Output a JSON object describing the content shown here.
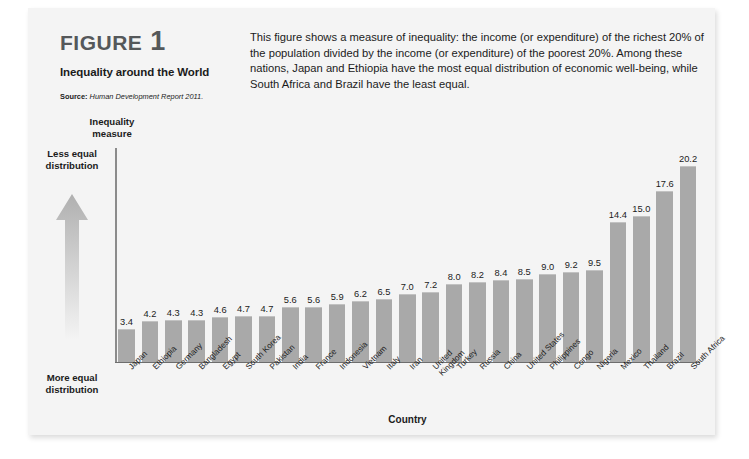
{
  "figure": {
    "label_word": "FIGURE",
    "label_number": "1",
    "subtitle": "Inequality around the World",
    "source_label": "Source:",
    "source_text": "Human Development Report 2011.",
    "description": "This figure shows a measure of inequality: the income (or expenditure) of the richest 20% of the population divided by the income (or expenditure) of the poorest 20%. Among these nations, Japan and Ethiopia have the most equal distribution of economic well-being, while South Africa and Brazil have the least equal."
  },
  "scale_legend": {
    "top_label": "Less equal distribution",
    "bottom_label": "More equal distribution",
    "arrow_icon": "up-arrow-gradient-icon",
    "arrow_color": "#b4b4b4"
  },
  "colors": {
    "bar_fill": "#a9a9a9",
    "bar_top_edge": "#c2c2c2",
    "panel_background": "#f4f4f4",
    "plot_background": "#ffffff",
    "axis_line": "#6d6d6d",
    "text": "#1b1b1b",
    "figure_label": "#55585a"
  },
  "chart_data": {
    "type": "bar",
    "title": "Inequality around the World",
    "xlabel": "Country",
    "ylabel": "Inequality measure",
    "ylim": [
      0,
      22
    ],
    "grid": false,
    "legend": "none",
    "orientation": "vertical",
    "categories": [
      "Japan",
      "Ethiopia",
      "Germany",
      "Bangladesh",
      "Egypt",
      "South Korea",
      "Pakistan",
      "India",
      "France",
      "Indonesia",
      "Vietnam",
      "Italy",
      "Iran",
      "United Kingdom",
      "Turkey",
      "Russia",
      "China",
      "United States",
      "Philippines",
      "Congo",
      "Nigeria",
      "Mexico",
      "Thailand",
      "Brazil",
      "South Africa"
    ],
    "values": [
      3.4,
      4.2,
      4.3,
      4.3,
      4.6,
      4.7,
      4.7,
      5.6,
      5.6,
      5.9,
      6.2,
      6.5,
      7.0,
      7.2,
      8.0,
      8.2,
      8.4,
      8.5,
      9.0,
      9.2,
      9.5,
      14.4,
      15.0,
      17.6,
      20.2
    ],
    "value_labels": [
      "3.4",
      "4.2",
      "4.3",
      "4.3",
      "4.6",
      "4.7",
      "4.7",
      "5.6",
      "5.6",
      "5.9",
      "6.2",
      "6.5",
      "7.0",
      "7.2",
      "8.0",
      "8.2",
      "8.4",
      "8.5",
      "9.0",
      "9.2",
      "9.5",
      "14.4",
      "15.0",
      "17.6",
      "20.2"
    ],
    "two_line_labels": [
      "United Kingdom"
    ]
  }
}
